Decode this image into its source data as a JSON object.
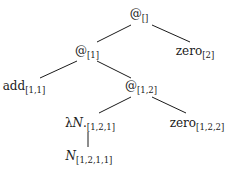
{
  "diagram": {
    "type": "tree",
    "nodes": [
      {
        "id": "root",
        "base": "@",
        "sub": "[]",
        "x": 139,
        "y": 15
      },
      {
        "id": "zero2",
        "base": "zero",
        "sub": "[2]",
        "x": 195,
        "y": 52
      },
      {
        "id": "app1",
        "base": "@",
        "sub": "[1]",
        "x": 87,
        "y": 52
      },
      {
        "id": "add11",
        "base": "add",
        "sub": "[1,1]",
        "x": 24,
        "y": 87
      },
      {
        "id": "app12",
        "base": "@",
        "sub": "[1,2]",
        "x": 141,
        "y": 87
      },
      {
        "id": "lam121",
        "base_prefix": "λ",
        "base_var": "N",
        "base_suffix": ".",
        "sub": "[1,2,1]",
        "x": 90,
        "y": 124
      },
      {
        "id": "zero122",
        "base": "zero",
        "sub": "[1,2,2]",
        "x": 197,
        "y": 124
      },
      {
        "id": "n1211",
        "base_var": "N",
        "sub": "[1,2,1,1]",
        "x": 89,
        "y": 157
      }
    ],
    "edges": [
      {
        "from": "root",
        "to": "app1",
        "x1": 131,
        "y1": 25,
        "x2": 97,
        "y2": 42
      },
      {
        "from": "root",
        "to": "zero2",
        "x1": 152,
        "y1": 25,
        "x2": 190,
        "y2": 42
      },
      {
        "from": "app1",
        "to": "add11",
        "x1": 77,
        "y1": 61,
        "x2": 40,
        "y2": 78
      },
      {
        "from": "app1",
        "to": "app12",
        "x1": 97,
        "y1": 61,
        "x2": 131,
        "y2": 78
      },
      {
        "from": "app12",
        "to": "lam121",
        "x1": 131,
        "y1": 97,
        "x2": 99,
        "y2": 113
      },
      {
        "from": "app12",
        "to": "zero122",
        "x1": 152,
        "y1": 97,
        "x2": 186,
        "y2": 113
      },
      {
        "from": "lam121",
        "to": "n1211",
        "x1": 88,
        "y1": 132,
        "x2": 88,
        "y2": 147
      }
    ]
  }
}
